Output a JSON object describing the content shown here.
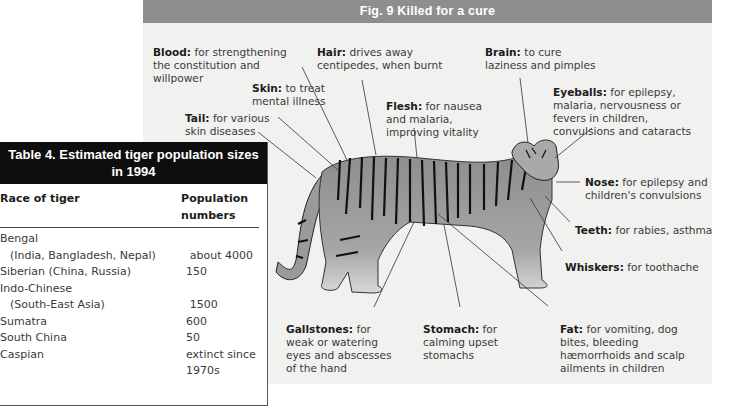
{
  "figure": {
    "title": "Fig. 9  Killed for a cure",
    "header_color": "#8e8e8e",
    "background_color": "#f1f1ef",
    "labels": [
      {
        "id": "blood",
        "part": "Blood:",
        "text": "for strengthening the constitution and willpower"
      },
      {
        "id": "hair",
        "part": "Hair:",
        "text": "drives away centipedes, when burnt"
      },
      {
        "id": "brain",
        "part": "Brain:",
        "text": "to cure laziness and pimples"
      },
      {
        "id": "skin",
        "part": "Skin:",
        "text": "to treat mental illness"
      },
      {
        "id": "flesh",
        "part": "Flesh:",
        "text": "for nausea and malaria, improving vitality"
      },
      {
        "id": "eyeballs",
        "part": "Eyeballs:",
        "text": "for epilepsy, malaria, nervousness or fevers in children, convulsions and cataracts"
      },
      {
        "id": "tail",
        "part": "Tail:",
        "text": "for various skin diseases"
      },
      {
        "id": "nose",
        "part": "Nose:",
        "text": " for epilepsy and children's convulsions"
      },
      {
        "id": "teeth",
        "part": "Teeth:",
        "text": "for rabies, asthma"
      },
      {
        "id": "whiskers",
        "part": "Whiskers:",
        "text": "for toothache"
      },
      {
        "id": "gallstones",
        "part": "Gallstones:",
        "text": "for weak or watering eyes and abscesses of the hand"
      },
      {
        "id": "stomach",
        "part": "Stomach:",
        "text": "for calming upset stomachs"
      },
      {
        "id": "fat",
        "part": "Fat:",
        "text": "for vomiting, dog bites, bleeding hæmorrhoids and scalp ailments in children"
      }
    ]
  },
  "table": {
    "title": "Table 4. Estimated tiger population sizes in 1994",
    "header_color": "#0e0e0e",
    "columns": [
      "Race of tiger",
      "Population numbers"
    ],
    "rows": [
      {
        "race": "Bengal",
        "population": ""
      },
      {
        "race": "(India, Bangladesh, Nepal)",
        "population": "about 4000",
        "indent": true
      },
      {
        "race": "Siberian (China, Russia)",
        "population": "150"
      },
      {
        "race": "Indo-Chinese",
        "population": ""
      },
      {
        "race": "(South-East Asia)",
        "population": "1500",
        "indent": true
      },
      {
        "race": "Sumatra",
        "population": "600"
      },
      {
        "race": "South China",
        "population": "50"
      },
      {
        "race": "Caspian",
        "population": "extinct since"
      },
      {
        "race": "",
        "population": "1970s"
      }
    ]
  }
}
